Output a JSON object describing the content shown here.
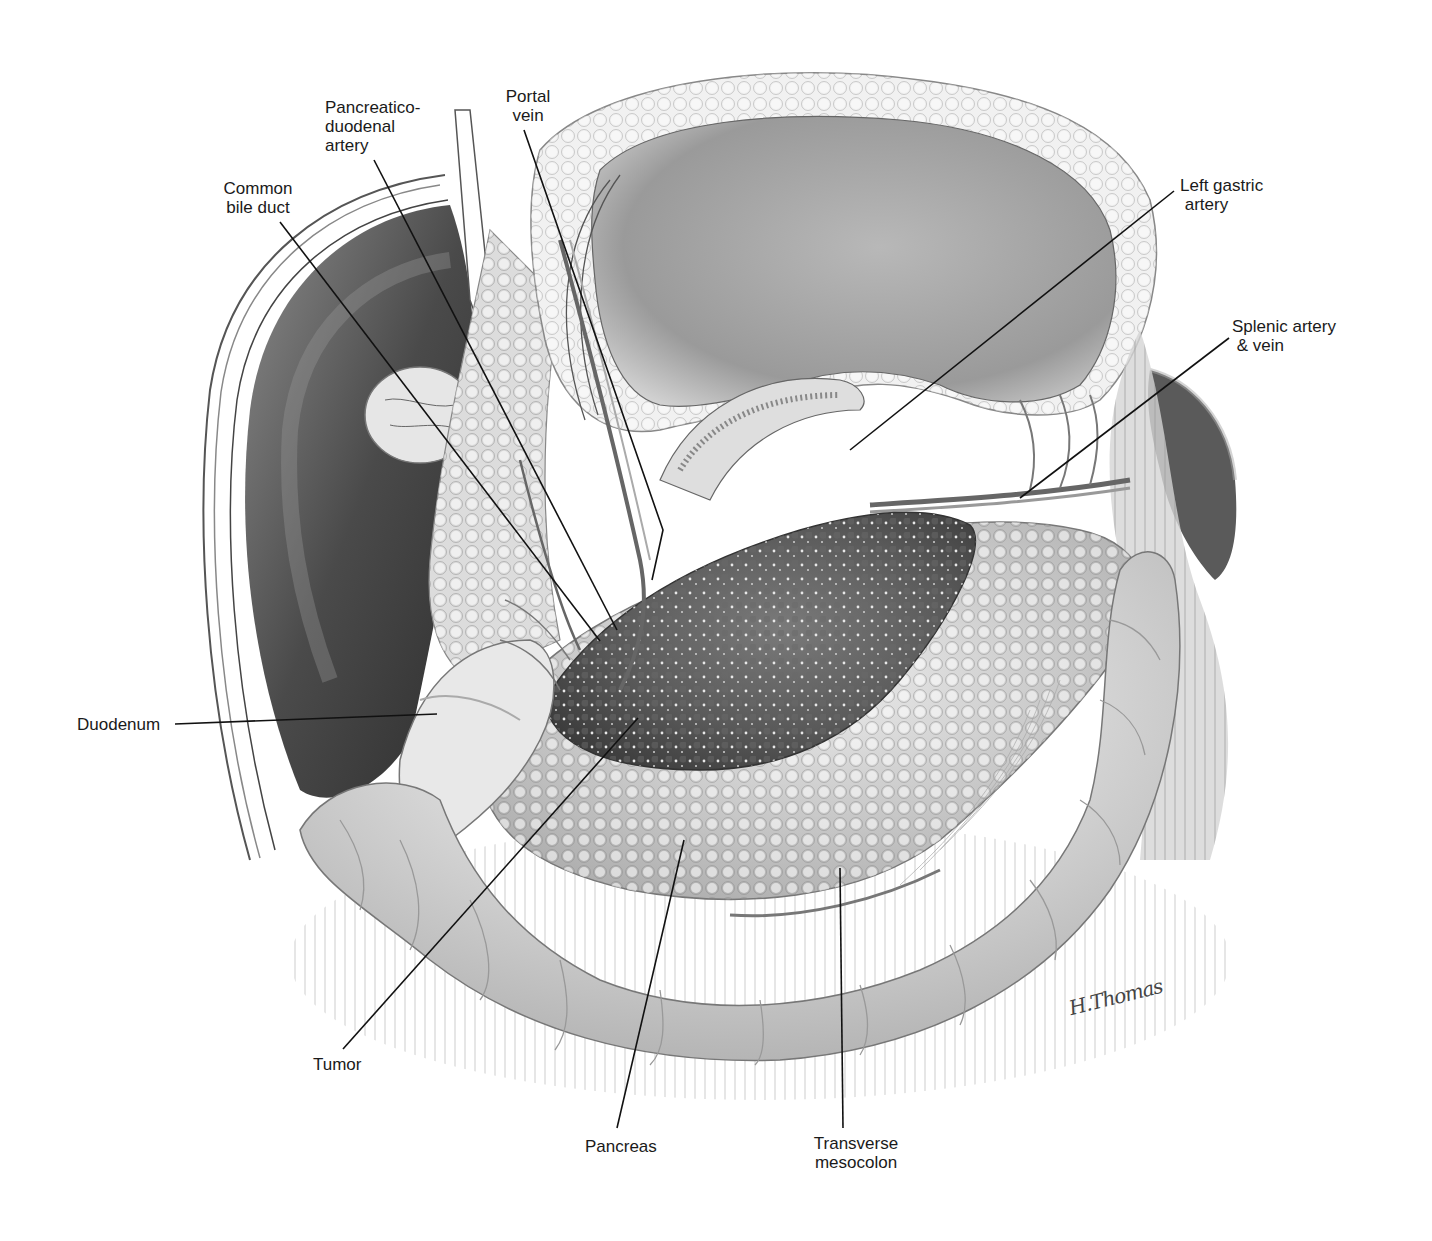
{
  "figure": {
    "type": "anatomical illustration",
    "signature": "H.Thomas"
  },
  "labels": [
    {
      "id": "portal-vein",
      "text": "Portal\nvein",
      "x": 498,
      "y": 87,
      "align": "center",
      "width": 60,
      "line": [
        [
          524,
          130
        ],
        [
          663,
          530
        ],
        [
          652,
          580
        ]
      ]
    },
    {
      "id": "pancreaticoduodenal-artery",
      "text": "Pancreatico-\nduodenal\nartery",
      "x": 325,
      "y": 98,
      "align": "left",
      "width": 110,
      "line": [
        [
          374,
          160
        ],
        [
          617,
          630
        ]
      ]
    },
    {
      "id": "common-bile-duct",
      "text": "Common\nbile duct",
      "x": 218,
      "y": 179,
      "align": "center",
      "width": 80,
      "line": [
        [
          280,
          222
        ],
        [
          600,
          641
        ]
      ]
    },
    {
      "id": "left-gastric-artery",
      "text": "Left gastric\n artery",
      "x": 1180,
      "y": 176,
      "align": "left",
      "width": 100,
      "line": [
        [
          1174,
          191
        ],
        [
          850,
          450
        ]
      ]
    },
    {
      "id": "splenic-artery-vein",
      "text": "Splenic artery\n & vein",
      "x": 1232,
      "y": 317,
      "align": "left",
      "width": 122,
      "line": [
        [
          1229,
          338
        ],
        [
          1020,
          498
        ]
      ]
    },
    {
      "id": "duodenum",
      "text": "Duodenum",
      "x": 77,
      "y": 715,
      "align": "left",
      "width": 90,
      "line": [
        [
          175,
          724
        ],
        [
          437,
          714
        ]
      ]
    },
    {
      "id": "tumor",
      "text": "Tumor",
      "x": 313,
      "y": 1055,
      "align": "left",
      "width": 60,
      "line": [
        [
          343,
          1049
        ],
        [
          638,
          718
        ]
      ]
    },
    {
      "id": "pancreas",
      "text": "Pancreas",
      "x": 585,
      "y": 1137,
      "align": "left",
      "width": 80,
      "line": [
        [
          617,
          1128
        ],
        [
          684,
          840
        ]
      ]
    },
    {
      "id": "transverse-mesocolon",
      "text": "Transverse\nmesocolon",
      "x": 800,
      "y": 1134,
      "align": "center",
      "width": 112,
      "line": [
        [
          843,
          1128
        ],
        [
          840,
          868
        ]
      ]
    }
  ],
  "colors": {
    "background": "#ffffff",
    "ink": "#1a1a1a",
    "liver_dark": "#3a3a3a",
    "liver_mid": "#6e6e6e",
    "tissue_light": "#e6e6e6",
    "tissue_mid": "#bdbdbd",
    "tumor_dark": "#4d4d4d",
    "stomach": "#a8a8a8"
  }
}
